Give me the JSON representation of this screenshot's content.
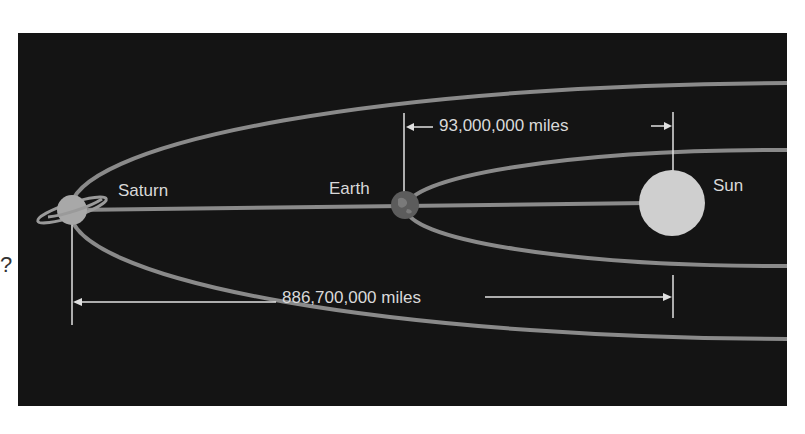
{
  "diagram": {
    "bodies": [
      {
        "name": "Saturn",
        "label": "Saturn"
      },
      {
        "name": "Earth",
        "label": "Earth"
      },
      {
        "name": "Sun",
        "label": "Sun"
      }
    ],
    "distances": {
      "earth_sun": "93,000,000 miles",
      "saturn_sun": "886,700,000 miles"
    },
    "side_mark": "?",
    "colors": {
      "background": "#141414",
      "orbit": "#8a8a8a",
      "text": "#d9d9d9",
      "sun": "#cfcfcf"
    }
  }
}
